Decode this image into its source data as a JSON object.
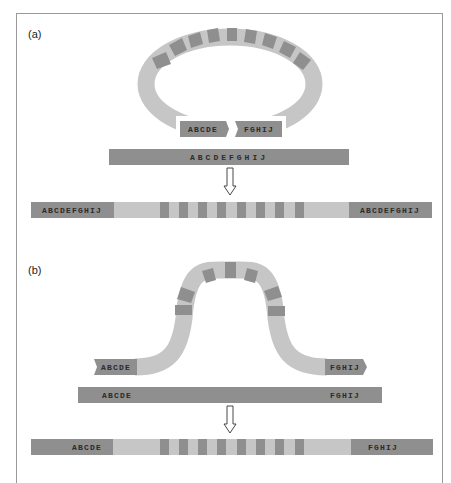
{
  "panels": {
    "a": {
      "label": "(a)",
      "ring_left_label": "ABCDE",
      "ring_right_label": "FGHIJ",
      "target_label": "ABCDEFGHIJ",
      "result_left_label": "ABCDEFGHIJ",
      "result_right_label": "ABCDEFGHIJ"
    },
    "b": {
      "label": "(b)",
      "arch_left_label": "ABCDE",
      "arch_right_label": "FGHIJ",
      "target_left_label": "ABCDE",
      "target_right_label": "FGHIJ",
      "result_left_label": "ABCDE",
      "result_right_label": "FGHIJ"
    }
  },
  "colors": {
    "dark_segment": "#8f8f8f",
    "light_segment": "#c6c6c6",
    "frame": "#9a9a9a",
    "text": "#2b2b2b"
  }
}
